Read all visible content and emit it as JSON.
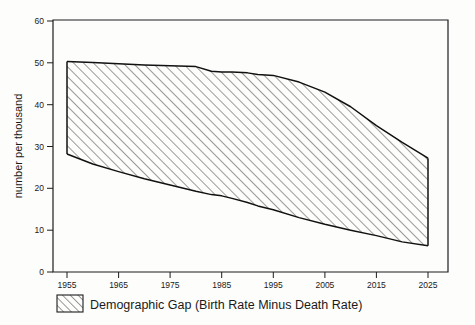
{
  "chart_data": {
    "type": "area",
    "title": "",
    "subtitle": "",
    "xlabel": "",
    "ylabel": "number per thousand",
    "xlim": [
      1955,
      2025
    ],
    "ylim": [
      0,
      60
    ],
    "grid": false,
    "legend_position": "bottom",
    "x_ticks": [
      "1955",
      "1965",
      "1975",
      "1985",
      "1995",
      "2005",
      "2015",
      "2025"
    ],
    "x_tick_values": [
      1955,
      1965,
      1975,
      1985,
      1995,
      2005,
      2015,
      2025
    ],
    "y_ticks": [
      "0",
      "10",
      "20",
      "30",
      "40",
      "50",
      "60"
    ],
    "y_tick_values": [
      0,
      10,
      20,
      30,
      40,
      50,
      60
    ],
    "x": [
      1955,
      1960,
      1965,
      1970,
      1975,
      1980,
      1983,
      1985,
      1987,
      1990,
      1992,
      1995,
      2000,
      2005,
      2010,
      2015,
      2020,
      2025
    ],
    "series": [
      {
        "name": "Birth Rate",
        "role": "upper-bound",
        "values": [
          50.3,
          50.1,
          49.8,
          49.5,
          49.3,
          49.1,
          48.0,
          47.8,
          47.8,
          47.6,
          47.2,
          47.0,
          45.4,
          43.0,
          39.5,
          35.0,
          31.0,
          27.2
        ]
      },
      {
        "name": "Death Rate",
        "role": "lower-bound",
        "values": [
          28.2,
          25.8,
          24.0,
          22.3,
          20.8,
          19.3,
          18.5,
          18.2,
          17.6,
          16.6,
          15.8,
          14.9,
          13.0,
          11.4,
          10.0,
          8.7,
          7.2,
          6.3
        ]
      },
      {
        "name": "Demographic Gap (Birth Rate Minus Death Rate)",
        "role": "shaded-band",
        "values": [
          22.1,
          24.3,
          25.8,
          27.2,
          28.5,
          29.8,
          29.5,
          29.6,
          30.2,
          31.0,
          31.4,
          32.1,
          32.4,
          31.6,
          29.5,
          26.3,
          23.8,
          20.9
        ]
      }
    ],
    "annotations": []
  },
  "axes": {
    "y_axis_title": "number per thousand",
    "y_tick_labels": [
      "60",
      "50",
      "40",
      "30",
      "20",
      "10",
      "0"
    ],
    "x_tick_labels": [
      "1955",
      "1965",
      "1975",
      "1985",
      "1995",
      "2005",
      "2015",
      "2025"
    ]
  },
  "legend": {
    "entries": [
      {
        "label": "Demographic Gap (Birth Rate Minus Death Rate)",
        "swatch": "hatched-diagonal-swatch"
      }
    ]
  },
  "colors": {
    "axis": "#1d1d1d",
    "outline": "#111111",
    "hatch": "#222222",
    "background": "#fdfdfc",
    "text": "#1a1a1a"
  }
}
